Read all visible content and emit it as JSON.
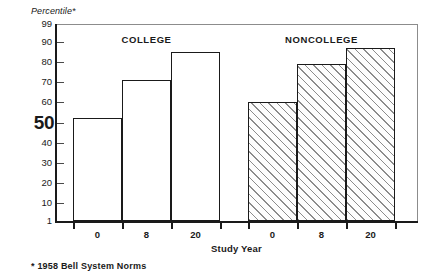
{
  "chart_data": {
    "type": "bar",
    "title": "",
    "ylabel": "Percentile*",
    "xlabel": "Study Year",
    "categories": [
      "0",
      "8",
      "20"
    ],
    "series": [
      {
        "name": "COLLEGE",
        "values": [
          52,
          71,
          85
        ],
        "fill": "white"
      },
      {
        "name": "NONCOLLEGE",
        "values": [
          60,
          79,
          87
        ],
        "fill": "hatched"
      }
    ],
    "ylim": [
      1,
      99
    ],
    "yticks": [
      99,
      90,
      80,
      70,
      60,
      50,
      40,
      30,
      20,
      10,
      1
    ],
    "ytick_labels": [
      "99",
      "90",
      "80",
      "70",
      "60",
      "50",
      "40",
      "30",
      "20",
      "10",
      "1"
    ],
    "emphasized_ytick": "50",
    "grid": false,
    "legend": "none",
    "annotations": [
      "* 1958 Bell System Norms"
    ]
  },
  "axes": {
    "y_title": "Percentile*",
    "x_title": "Study Year"
  },
  "groups": [
    {
      "label": "COLLEGE",
      "bars": [
        {
          "category": "0",
          "value": 52
        },
        {
          "category": "8",
          "value": 71
        },
        {
          "category": "20",
          "value": 85
        }
      ]
    },
    {
      "label": "NONCOLLEGE",
      "bars": [
        {
          "category": "0",
          "value": 60
        },
        {
          "category": "8",
          "value": 79
        },
        {
          "category": "20",
          "value": 87
        }
      ]
    }
  ],
  "footnote": "* 1958 Bell System Norms",
  "colors": {
    "axis": "#1a1a1a",
    "frame": "#8c8c8c",
    "bar_outline": "#1a1a1a",
    "hatch": "#787878",
    "background": "#ffffff"
  }
}
